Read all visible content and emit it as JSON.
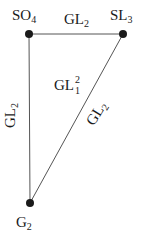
{
  "diagram": {
    "colors": {
      "edge": "#555555",
      "node": "#1a1a1a",
      "text": "#1a1a1a",
      "background": "#ffffff"
    },
    "nodes": [
      {
        "id": "SO4",
        "base": "SO",
        "subscript": "4",
        "x": 29,
        "y": 34
      },
      {
        "id": "SL3",
        "base": "SL",
        "subscript": "3",
        "x": 123,
        "y": 34
      },
      {
        "id": "G2",
        "base": "G",
        "subscript": "2",
        "x": 30,
        "y": 203
      }
    ],
    "edges": [
      {
        "from": "SO4",
        "to": "SL3",
        "label_base": "GL",
        "label_subscript": "2"
      },
      {
        "from": "SO4",
        "to": "G2",
        "label_base": "GL",
        "label_subscript": "2"
      },
      {
        "from": "SL3",
        "to": "G2",
        "label_base": "GL",
        "label_subscript": "2"
      }
    ],
    "interior_label": {
      "base": "GL",
      "subscript": "1",
      "superscript": "2"
    }
  }
}
